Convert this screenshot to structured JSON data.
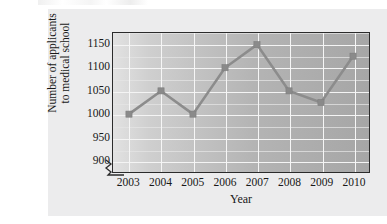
{
  "figure": {
    "background_color": "#ececed",
    "plot_background_colors": [
      "#e2e2e2",
      "#a6a6a6"
    ],
    "line_color": "#8c8c8c",
    "gridline_color": "#f4f4f4",
    "axis_color": "#2b2b2b"
  },
  "chart_data": {
    "type": "line",
    "title": "",
    "xlabel": "Year",
    "ylabel": "Number of applicants to medical school",
    "ylabel_lines": [
      "Number of applicants",
      "to medical school"
    ],
    "categories": [
      "2003",
      "2004",
      "2005",
      "2006",
      "2007",
      "2008",
      "2009",
      "2010"
    ],
    "values": [
      1000,
      1050,
      1000,
      1100,
      1150,
      1050,
      1025,
      1125
    ],
    "x": [
      2003,
      2004,
      2005,
      2006,
      2007,
      2008,
      2009,
      2010
    ],
    "ylim": [
      875,
      1175
    ],
    "xlim": [
      2002.5,
      2010.5
    ],
    "ytick_labels": [
      "1150",
      "1100",
      "1050",
      "1000",
      "950",
      "900"
    ],
    "ytick_values": [
      1150,
      1100,
      1050,
      1000,
      950,
      900
    ],
    "xtick_labels": [
      "2003",
      "2004",
      "2005",
      "2006",
      "2007",
      "2008",
      "2009",
      "2010"
    ],
    "y_major_step": 50,
    "y_minor_step": 25,
    "grid": true,
    "grid_axis": "both",
    "legend": false,
    "legend_position": "none",
    "marker": "square",
    "axis_break": true,
    "annotations": []
  }
}
